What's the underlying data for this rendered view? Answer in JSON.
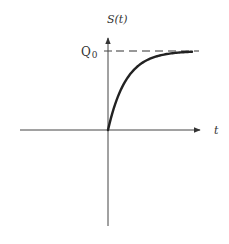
{
  "chart_data": {
    "type": "line",
    "title": "",
    "xlabel": "t",
    "ylabel": "S(t)",
    "asymptote_label": "Q",
    "asymptote_subscript": "0",
    "series": [
      {
        "name": "S(t)",
        "x": [
          0,
          0.5,
          1,
          1.5,
          2,
          2.5,
          3,
          3.5,
          4,
          4.5,
          5
        ],
        "values": [
          0,
          0.39,
          0.63,
          0.78,
          0.86,
          0.92,
          0.95,
          0.97,
          0.98,
          0.99,
          0.99
        ]
      }
    ],
    "asymptote": {
      "y": 1,
      "style": "dashed",
      "label": "Q0"
    },
    "grid": false,
    "legend": "none"
  },
  "labels": {
    "y_axis": "S(t)",
    "x_axis": "t",
    "q_main": "Q",
    "q_sub": "0"
  }
}
